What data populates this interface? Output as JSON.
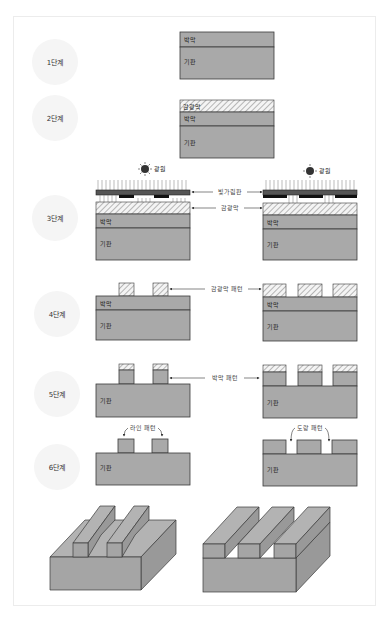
{
  "header": {
    "cut_off_title": "··· ···"
  },
  "steps": [
    {
      "label": "1단계"
    },
    {
      "label": "2단계"
    },
    {
      "label": "3단계"
    },
    {
      "label": "4단계"
    },
    {
      "label": "5단계"
    },
    {
      "label": "6단계"
    }
  ],
  "layers": {
    "thin_film": "박막",
    "substrate": "기판",
    "photoresist": "감광막"
  },
  "callouts": {
    "light_source": "광원",
    "photomask": "빛가림판",
    "photoresist": "감광막",
    "photoresist_pattern": "감광막 패턴",
    "thin_film_pattern": "박막 패턴",
    "line_pattern": "라인 패턴",
    "trench_pattern": "도랑 패턴"
  },
  "colors": {
    "layer_fill": "#a9a9a9",
    "outline": "#3a3a3a",
    "step_circle": "#f5f5f5",
    "mask": "#555555"
  }
}
